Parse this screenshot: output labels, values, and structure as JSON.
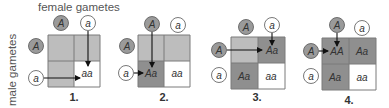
{
  "labels": {
    "female": "female gametes",
    "male": "male gametes"
  },
  "colors": {
    "filled": "#8f8f8f",
    "unfilled": "#bdbdbd",
    "white": "#ffffff",
    "grid": "#7a7a7a",
    "dominant_circle": "#9a9a9a",
    "recessive_circle": "#ffffff"
  },
  "panels": [
    {
      "number": "1.",
      "top_gametes": [
        "A",
        "a"
      ],
      "left_gametes": [
        "A",
        "a"
      ],
      "cells": [
        "",
        "",
        "",
        "aa"
      ],
      "highlight": "aa"
    },
    {
      "number": "2.",
      "top_gametes": [
        "A",
        "a"
      ],
      "left_gametes": [
        "A",
        "a"
      ],
      "cells": [
        "",
        "",
        "Aa",
        "aa"
      ],
      "highlight": "Aa"
    },
    {
      "number": "3.",
      "top_gametes": [
        "A",
        "a"
      ],
      "left_gametes": [
        "A",
        "a"
      ],
      "cells": [
        "",
        "Aa",
        "Aa",
        "aa"
      ],
      "highlight": "Aa"
    },
    {
      "number": "4.",
      "top_gametes": [
        "A",
        "a"
      ],
      "left_gametes": [
        "A",
        "a"
      ],
      "cells": [
        "AA",
        "Aa",
        "Aa",
        "aa"
      ],
      "highlight": "AA"
    }
  ]
}
